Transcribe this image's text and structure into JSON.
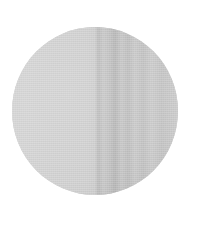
{
  "image": {
    "subject": "circular fabric swatch",
    "shape": "circle",
    "colors": {
      "background": "#ffffff",
      "fabric_light": "#d3d3d3",
      "fabric_fold_dark": "#b8b8b8",
      "fabric_fold_mid": "#c6c6c6"
    }
  }
}
